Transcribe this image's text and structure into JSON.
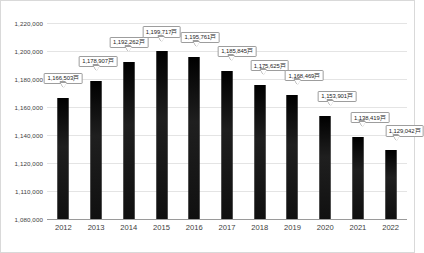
{
  "chart_data": {
    "type": "bar",
    "title": "",
    "subtitle": "",
    "xlabel": "",
    "ylabel": "",
    "categories": [
      "2012",
      "2013",
      "2014",
      "2015",
      "2016",
      "2017",
      "2018",
      "2019",
      "2020",
      "2021",
      "2022"
    ],
    "values": [
      1166503,
      1178907,
      1192262,
      1199717,
      1195761,
      1185845,
      1175625,
      1168469,
      1153901,
      1138419,
      1129042
    ],
    "data_labels": [
      "1,166,503戸",
      "1,178,907戸",
      "1,192,262戸",
      "1,199,717戸",
      "1,195,761戸",
      "1,185,845戸",
      "1,175,625戸",
      "1,168,469戸",
      "1,153,901戸",
      "1,138,419戸",
      "1,129,042戸"
    ],
    "ylim": [
      1080000,
      1220000
    ],
    "y_tick_labels": [
      "1,220,000",
      "1,200,000",
      "1,180,000",
      "1,160,000",
      "1,140,000",
      "1,120,000",
      "1,110,000",
      "1,080,000"
    ],
    "grid": true,
    "legend": false,
    "legend_position": "none",
    "series": [
      {
        "name": "",
        "values": [
          1166503,
          1178907,
          1192262,
          1199717,
          1195761,
          1185845,
          1175625,
          1168469,
          1153901,
          1138419,
          1129042
        ]
      }
    ],
    "colors": {
      "bar": "#1a1a1a",
      "gridline": "#e4e4e4",
      "axis": "#9a9a9a",
      "callout_border": "#9d9d9d",
      "callout_fill": "#ffffff",
      "text": "#3d3d3d",
      "frame_border": "#d9d9d9"
    }
  }
}
